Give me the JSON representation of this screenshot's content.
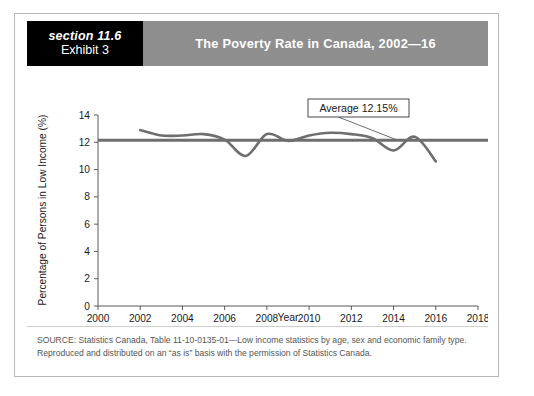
{
  "header": {
    "section_label": "section 11.6",
    "exhibit_label": "Exhibit 3",
    "title": "The Poverty Rate in Canada, 2002—16",
    "section_block_color": "#000000",
    "title_block_color": "#8e8e8e"
  },
  "source": {
    "text": "SOURCE: Statistics Canada, Table 11-10-0135-01—Low income statistics by age, sex and economic family type. Reproduced and distributed on an “as is” basis with the permission of Statistics Canada."
  },
  "callout": {
    "label": "Average 12.15%"
  },
  "chart_data": {
    "type": "line",
    "title": "The Poverty Rate in Canada, 2002—16",
    "xlabel": "Year",
    "ylabel": "Percentage of Persons in Low Income (%)",
    "xlim": [
      2000,
      2018
    ],
    "ylim": [
      0,
      14
    ],
    "xticks": [
      2000,
      2002,
      2004,
      2006,
      2008,
      2010,
      2012,
      2014,
      2016,
      2018
    ],
    "yticks": [
      0,
      2,
      4,
      6,
      8,
      10,
      12,
      14
    ],
    "grid": false,
    "legend": false,
    "line_color": "#6e6e6e",
    "average_line_color": "#6e6e6e",
    "series": [
      {
        "name": "Poverty rate",
        "x": [
          2002,
          2003,
          2004,
          2005,
          2006,
          2007,
          2008,
          2009,
          2010,
          2011,
          2012,
          2013,
          2014,
          2015,
          2016
        ],
        "values": [
          12.9,
          12.5,
          12.5,
          12.6,
          12.2,
          11.0,
          12.6,
          12.1,
          12.5,
          12.7,
          12.6,
          12.3,
          11.4,
          12.4,
          10.6
        ]
      }
    ],
    "average": {
      "name": "Average 12.15%",
      "value": 12.15,
      "x_start": 2000,
      "x_end": 2019
    },
    "annotations": [
      {
        "text": "Average 12.15%",
        "points_to_x": 2014.2,
        "points_to_y": 12.15
      }
    ]
  }
}
